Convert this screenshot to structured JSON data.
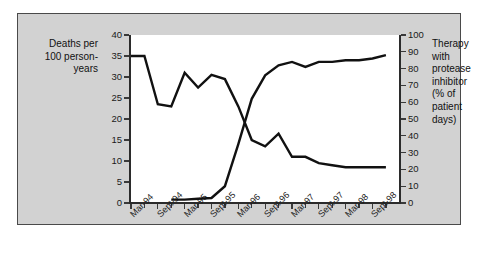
{
  "labels": {
    "left_title": "Deaths per 100 person-years",
    "right_title": "Therapy with protease inhibitor (% of patient days)"
  },
  "chart_data": {
    "type": "line",
    "title": "",
    "xlabel": "",
    "ylabel": "Deaths per 100 person-years",
    "y2label": "Therapy with protease inhibitor (% of patient days)",
    "ylim": [
      0,
      40
    ],
    "y2lim": [
      0,
      100
    ],
    "grid": false,
    "legend": "none",
    "yticks": [
      0,
      5,
      10,
      15,
      20,
      25,
      30,
      35,
      40
    ],
    "y2ticks": [
      0,
      10,
      20,
      30,
      40,
      50,
      60,
      70,
      80,
      90,
      100
    ],
    "xtick_labels": [
      "Mar-94",
      "Sept-94",
      "Mar-95",
      "Sept-95",
      "Mar-96",
      "Sept-96",
      "Mar-97",
      "Sept-97",
      "Mar-98",
      "Sept-98"
    ],
    "x": [
      "Mar-94",
      "Jun-94",
      "Sept-94",
      "Dec-94",
      "Mar-95",
      "Jun-95",
      "Sept-95",
      "Dec-95",
      "Mar-96",
      "Jun-96",
      "Sept-96",
      "Dec-96",
      "Mar-97",
      "Jun-97",
      "Sept-97",
      "Dec-97",
      "Mar-98",
      "Jun-98",
      "Sept-98",
      "Dec-98"
    ],
    "series": [
      {
        "name": "Deaths per 100 person-years",
        "axis": "left",
        "color": "#111111",
        "values": [
          35,
          35,
          23.5,
          23,
          31,
          27.5,
          30.5,
          29.5,
          23,
          15,
          13.5,
          16.5,
          11,
          11,
          9.5,
          9,
          8.5,
          8.5,
          8.5,
          8.5
        ]
      },
      {
        "name": "Therapy with protease inhibitor (% of patient days)",
        "axis": "right",
        "color": "#111111",
        "values": [
          null,
          null,
          null,
          2,
          2,
          2.5,
          3,
          10,
          35,
          62,
          76,
          82,
          84,
          81,
          84,
          84,
          85,
          85,
          86,
          88
        ]
      }
    ]
  }
}
